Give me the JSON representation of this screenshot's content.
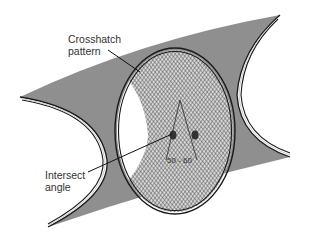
{
  "diagram": {
    "labels": {
      "crosshatch": "Crosshatch\npattern",
      "intersect": "Intersect\nangle",
      "angle_range": "50 - 60"
    },
    "colors": {
      "band": "#8f8f8f",
      "outline": "#1a1a1a",
      "hatch": "#555555",
      "hatch_bg": "#d8d8d8",
      "background": "#ffffff"
    }
  }
}
